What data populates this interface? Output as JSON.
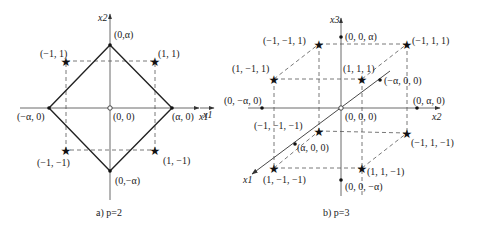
{
  "diagram_a": {
    "caption": "a) p=2",
    "axes": {
      "x": "x1",
      "y": "x2"
    },
    "origin_label": "(0, 0)",
    "vertices": [
      {
        "label": "(0,α)",
        "pos": "top"
      },
      {
        "label": "(α, 0)",
        "pos": "right"
      },
      {
        "label": "(0,−α)",
        "pos": "bottom"
      },
      {
        "label": "(−α, 0)",
        "pos": "left"
      }
    ],
    "stars": [
      {
        "label": "(−1, 1)"
      },
      {
        "label": "(1, 1)"
      },
      {
        "label": "(−1, −1)"
      },
      {
        "label": "(1, −1)"
      }
    ]
  },
  "diagram_b": {
    "caption": "b) p=3",
    "axes": {
      "x1": "x1",
      "x2": "x2",
      "x3": "x3"
    },
    "origin_label": "(0, 0, 0)",
    "axis_points": [
      {
        "label": "(0, 0, α)"
      },
      {
        "label": "(0, 0, −α)"
      },
      {
        "label": "(0, −α, 0)"
      },
      {
        "label": "(0, α, 0)"
      },
      {
        "label": "(−α, 0, 0)"
      },
      {
        "label": "(α, 0, 0)"
      }
    ],
    "stars": [
      {
        "label": "(−1, −1, 1)"
      },
      {
        "label": "(−1, 1, 1)"
      },
      {
        "label": "(1, −1, 1)"
      },
      {
        "label": "(1, 1, 1)"
      },
      {
        "label": "(−1, −1, −1)"
      },
      {
        "label": "(−1, 1, −1)"
      },
      {
        "label": "(1, −1, −1)"
      },
      {
        "label": "(1, 1, −1)"
      }
    ]
  },
  "colors": {
    "line": "#222222",
    "background": "#ffffff"
  }
}
